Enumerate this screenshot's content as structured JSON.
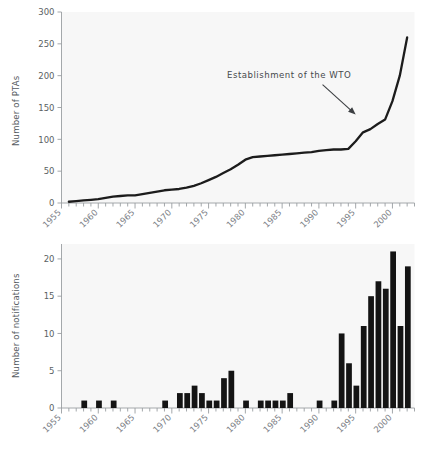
{
  "chart_data": [
    {
      "id": "top",
      "type": "line",
      "title": "",
      "xlabel": "",
      "ylabel": "Number of PTAs",
      "xlim": [
        1955,
        2003
      ],
      "ylim": [
        0,
        300
      ],
      "yticks": [
        0,
        50,
        100,
        150,
        200,
        250,
        300
      ],
      "xticks": [
        1955,
        1960,
        1965,
        1970,
        1975,
        1980,
        1985,
        1990,
        1995,
        2000
      ],
      "grid": false,
      "legend": "none",
      "x": [
        1956,
        1957,
        1958,
        1959,
        1960,
        1961,
        1962,
        1963,
        1964,
        1965,
        1966,
        1967,
        1968,
        1969,
        1970,
        1971,
        1972,
        1973,
        1974,
        1975,
        1976,
        1977,
        1978,
        1979,
        1980,
        1981,
        1982,
        1983,
        1984,
        1985,
        1986,
        1987,
        1988,
        1989,
        1990,
        1991,
        1992,
        1993,
        1994,
        1995,
        1996,
        1997,
        1998,
        1999,
        2000,
        2001,
        2002
      ],
      "values": [
        2,
        3,
        4,
        5,
        6,
        8,
        10,
        11,
        12,
        12,
        14,
        16,
        18,
        20,
        21,
        22,
        24,
        27,
        31,
        36,
        41,
        47,
        53,
        60,
        68,
        72,
        73,
        74,
        75,
        76,
        77,
        78,
        79,
        80,
        82,
        83,
        84,
        84,
        85,
        97,
        111,
        116,
        124,
        131,
        160,
        200,
        260
      ],
      "annotations": [
        {
          "text": "Establishment of the WTO",
          "text_x": 1977.5,
          "text_y": 197,
          "arrow_from_x": 1990.5,
          "arrow_from_y": 186,
          "arrow_to_x": 1995.0,
          "arrow_to_y": 139
        }
      ]
    },
    {
      "id": "bottom",
      "type": "bar",
      "title": "",
      "xlabel": "",
      "ylabel": "Number of notifications",
      "xlim": [
        1955,
        2003
      ],
      "ylim": [
        0,
        22
      ],
      "yticks": [
        0,
        5,
        10,
        15,
        20
      ],
      "xticks": [
        1955,
        1960,
        1965,
        1970,
        1975,
        1980,
        1985,
        1990,
        1995,
        2000
      ],
      "grid": false,
      "legend": "none",
      "categories": [
        1955,
        1956,
        1957,
        1958,
        1959,
        1960,
        1961,
        1962,
        1963,
        1964,
        1965,
        1966,
        1967,
        1968,
        1969,
        1970,
        1971,
        1972,
        1973,
        1974,
        1975,
        1976,
        1977,
        1978,
        1979,
        1980,
        1981,
        1982,
        1983,
        1984,
        1985,
        1986,
        1987,
        1988,
        1989,
        1990,
        1991,
        1992,
        1993,
        1994,
        1995,
        1996,
        1997,
        1998,
        1999,
        2000,
        2001,
        2002
      ],
      "values": [
        0,
        0,
        0,
        1,
        0,
        1,
        0,
        1,
        0,
        0,
        0,
        0,
        0,
        0,
        1,
        0,
        2,
        2,
        3,
        2,
        1,
        1,
        4,
        5,
        0,
        1,
        0,
        1,
        1,
        1,
        1,
        2,
        0,
        0,
        0,
        1,
        0,
        1,
        10,
        6,
        3,
        11,
        15,
        17,
        16,
        21,
        11,
        19,
        9
      ]
    }
  ],
  "figure": {
    "background_color": "#ffffff",
    "plot_background_color": "#f7f7f7",
    "line_color": "#1c1c1c",
    "bar_color": "#141414",
    "axis_color": "#9a9ea2",
    "tick_label_color": "#7b8086"
  }
}
